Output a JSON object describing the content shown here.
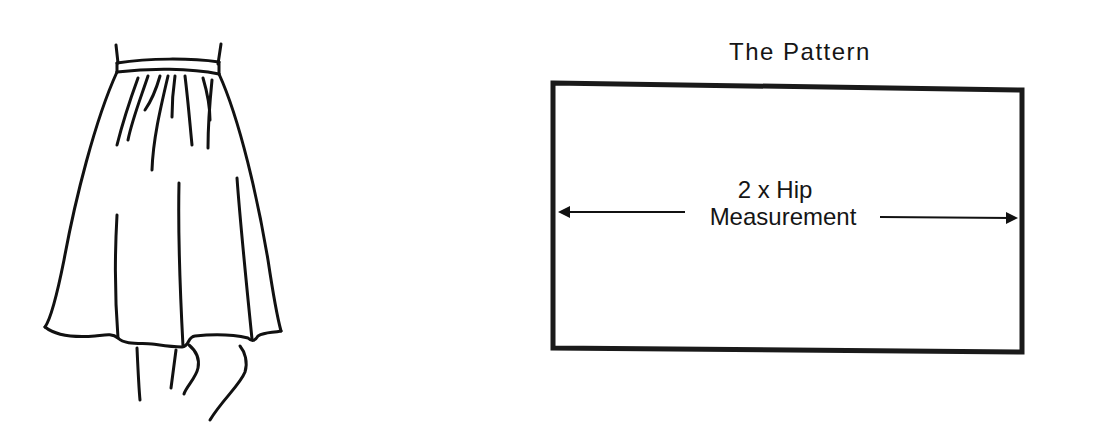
{
  "illustration": {
    "subject": "gathered skirt, rear view",
    "line_color": "#111111"
  },
  "pattern": {
    "title": "The Pattern",
    "dimension_label": {
      "line1": "2 x Hip",
      "line2": "Measurement"
    },
    "border_color": "#1a1a1a"
  }
}
